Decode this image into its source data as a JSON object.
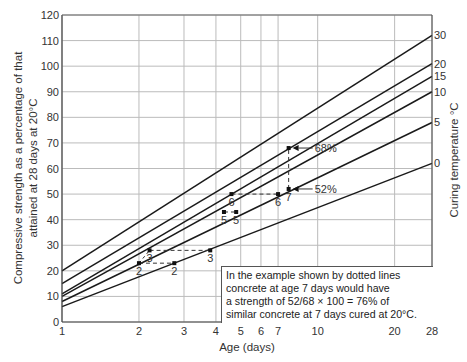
{
  "chart_data": {
    "type": "line",
    "title": "",
    "xlabel": "Age (days)",
    "ylabel": "Compressive strength as a percentage of that attained at 28 days at 20°C",
    "y2label": "Curing temperature °C",
    "xscale": "log",
    "xlim": [
      1,
      28
    ],
    "ylim": [
      0,
      120
    ],
    "x_ticks": [
      1,
      2,
      3,
      4,
      5,
      6,
      7,
      10,
      20,
      28
    ],
    "y_ticks": [
      0,
      10,
      20,
      30,
      40,
      50,
      60,
      70,
      80,
      90,
      100,
      110,
      120
    ],
    "grid": true,
    "series": [
      {
        "name": "30",
        "x": [
          1,
          28
        ],
        "values": [
          20,
          112
        ]
      },
      {
        "name": "20",
        "x": [
          1,
          28
        ],
        "values": [
          15,
          101
        ]
      },
      {
        "name": "15",
        "x": [
          1,
          28
        ],
        "values": [
          11,
          96
        ]
      },
      {
        "name": "10",
        "x": [
          1,
          28
        ],
        "values": [
          10,
          90
        ]
      },
      {
        "name": "5",
        "x": [
          1,
          28
        ],
        "values": [
          8,
          78
        ]
      },
      {
        "name": "0",
        "x": [
          1,
          28
        ],
        "values": [
          6,
          62
        ]
      }
    ],
    "example_points": [
      {
        "label": "2",
        "x": 2.0,
        "y": 23
      },
      {
        "label": "2",
        "x": 2.75,
        "y": 23
      },
      {
        "label": "3",
        "x": 2.2,
        "y": 28
      },
      {
        "label": "3",
        "x": 3.8,
        "y": 28
      },
      {
        "label": "5",
        "x": 4.3,
        "y": 43
      },
      {
        "label": "5",
        "x": 4.8,
        "y": 43
      },
      {
        "label": "6",
        "x": 4.6,
        "y": 50
      },
      {
        "label": "6",
        "x": 7.0,
        "y": 50
      },
      {
        "label": "7",
        "x": 7.7,
        "y": 52
      },
      {
        "label": "",
        "x": 7.7,
        "y": 68
      }
    ],
    "annotations": [
      {
        "text": "68%",
        "x": 7.7,
        "y": 68
      },
      {
        "text": "52%",
        "x": 7.7,
        "y": 52
      }
    ],
    "note": [
      "In the example shown by dotted lines",
      "concrete at age 7 days would have",
      "a strength of 52/68 × 100 = 76% of",
      "similar concrete at 7 days cured at 20°C."
    ]
  }
}
